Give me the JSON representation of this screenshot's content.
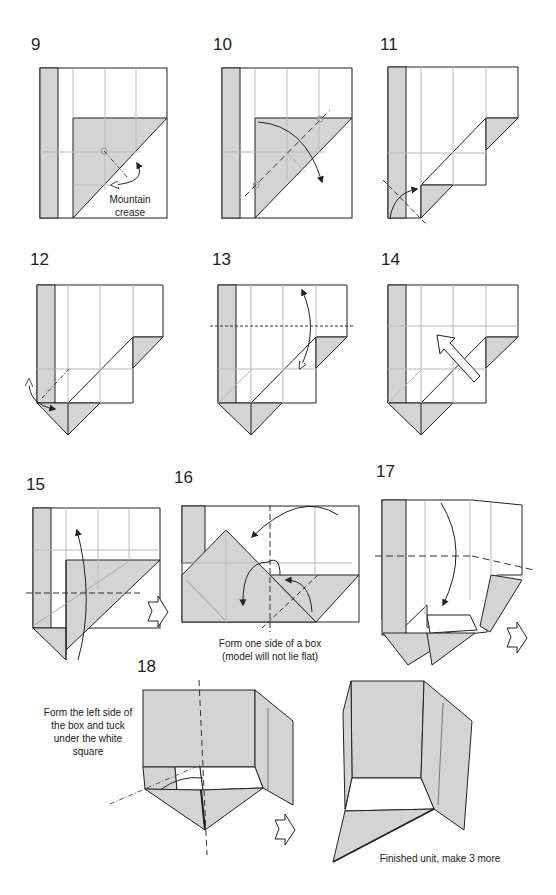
{
  "colors": {
    "paper_color_side": "#d4d4d4",
    "paper_white_side": "#ffffff",
    "line": "#222222",
    "crease": "#bbbbbb"
  },
  "steps": [
    {
      "number": "9",
      "caption": "Mountain\ncrease",
      "caption_lines": [
        "Mountain",
        "crease"
      ]
    },
    {
      "number": "10"
    },
    {
      "number": "11"
    },
    {
      "number": "12"
    },
    {
      "number": "13"
    },
    {
      "number": "14"
    },
    {
      "number": "15"
    },
    {
      "number": "16",
      "caption_lines": [
        "Form one side of a box",
        "(model will not lie flat)"
      ]
    },
    {
      "number": "17"
    },
    {
      "number": "18",
      "caption_lines": [
        "Form the left side of",
        "the box and tuck",
        "under the white",
        "square"
      ]
    },
    {
      "number": "",
      "caption_lines": [
        "Finished unit, make 3 more"
      ]
    }
  ],
  "symbols": [
    "mountain-fold-line",
    "valley-fold-line",
    "fold-arrow",
    "unfold-arrow",
    "push-arrow",
    "turn-over-arrow",
    "next-view-arrow"
  ]
}
